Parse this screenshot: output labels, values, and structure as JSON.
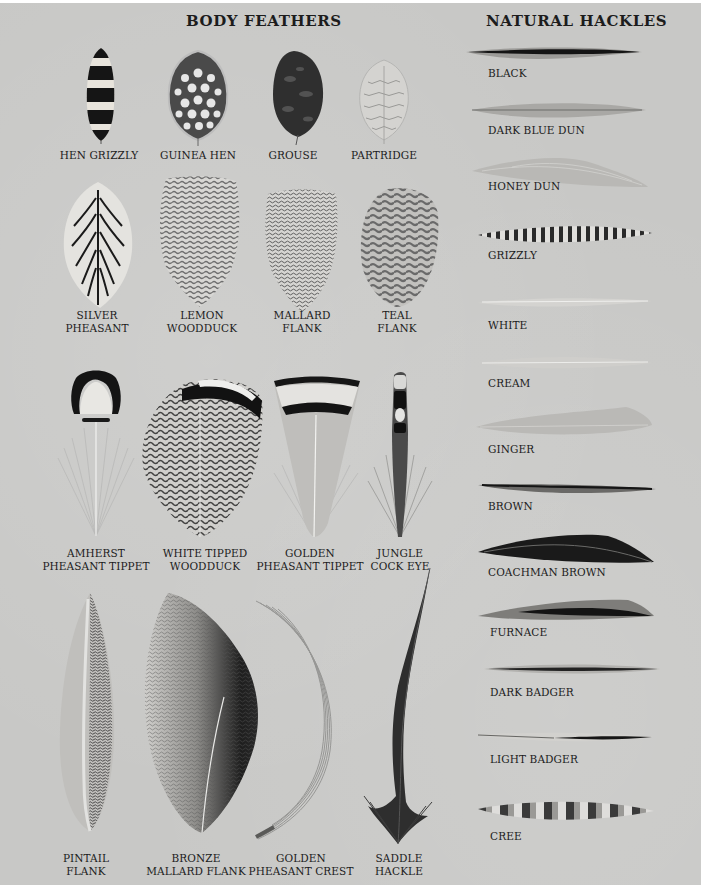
{
  "page": {
    "background": "#c8c8c6",
    "text_color": "#1c1c1c"
  },
  "body_feathers": {
    "title": "BODY FEATHERS",
    "rows": [
      [
        {
          "label": "HEN GRIZZLY",
          "icon": "hen-grizzly-feather-icon"
        },
        {
          "label": "GUINEA HEN",
          "icon": "guinea-hen-feather-icon"
        },
        {
          "label": "GROUSE",
          "icon": "grouse-feather-icon"
        },
        {
          "label": "PARTRIDGE",
          "icon": "partridge-feather-icon"
        }
      ],
      [
        {
          "label_line1": "SILVER",
          "label_line2": "PHEASANT",
          "icon": "silver-pheasant-feather-icon"
        },
        {
          "label_line1": "LEMON",
          "label_line2": "WOODDUCK",
          "icon": "lemon-woodduck-feather-icon"
        },
        {
          "label_line1": "MALLARD",
          "label_line2": "FLANK",
          "icon": "mallard-flank-feather-icon"
        },
        {
          "label_line1": "TEAL",
          "label_line2": "FLANK",
          "icon": "teal-flank-feather-icon"
        }
      ],
      [
        {
          "label_line1": "AMHERST",
          "label_line2": "PHEASANT TIPPET",
          "icon": "amherst-pheasant-tippet-feather-icon"
        },
        {
          "label_line1": "WHITE TIPPED",
          "label_line2": "WOODDUCK",
          "icon": "white-tipped-woodduck-feather-icon"
        },
        {
          "label_line1": "GOLDEN",
          "label_line2": "PHEASANT TIPPET",
          "icon": "golden-pheasant-tippet-feather-icon"
        },
        {
          "label_line1": "JUNGLE",
          "label_line2": "COCK EYE",
          "icon": "jungle-cock-eye-feather-icon"
        }
      ],
      [
        {
          "label_line1": "PINTAIL",
          "label_line2": "FLANK",
          "icon": "pintail-flank-feather-icon"
        },
        {
          "label_line1": "BRONZE",
          "label_line2": "MALLARD FLANK",
          "icon": "bronze-mallard-flank-feather-icon"
        },
        {
          "label_line1": "GOLDEN",
          "label_line2": "PHEASANT CREST",
          "icon": "golden-pheasant-crest-feather-icon"
        },
        {
          "label_line1": "SADDLE",
          "label_line2": "HACKLE",
          "icon": "saddle-hackle-feather-icon"
        }
      ]
    ]
  },
  "natural_hackles": {
    "title": "NATURAL HACKLES",
    "items": [
      {
        "label": "BLACK"
      },
      {
        "label": "DARK BLUE DUN"
      },
      {
        "label": "HONEY DUN"
      },
      {
        "label": "GRIZZLY"
      },
      {
        "label": "WHITE"
      },
      {
        "label": "CREAM"
      },
      {
        "label": "GINGER"
      },
      {
        "label": "BROWN"
      },
      {
        "label": "COACHMAN BROWN"
      },
      {
        "label": "FURNACE"
      },
      {
        "label": "DARK BADGER"
      },
      {
        "label": "LIGHT BADGER"
      },
      {
        "label": "CREE"
      }
    ]
  }
}
